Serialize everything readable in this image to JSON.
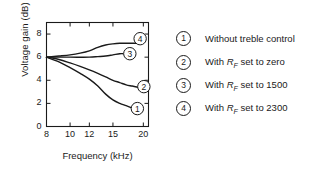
{
  "chart_data": {
    "type": "line",
    "title": "",
    "xlabel": "Frequency (kHz)",
    "ylabel": "Voltage gain (dB)",
    "x_ticks": [
      8,
      10,
      12,
      15,
      20
    ],
    "x_tick_labels": [
      "8",
      "10",
      "12",
      "15",
      "20"
    ],
    "y_ticks": [
      0,
      2,
      4,
      6,
      8
    ],
    "y_tick_labels": [
      "0",
      "2",
      "4",
      "6",
      "8"
    ],
    "xlim": [
      8,
      21
    ],
    "ylim": [
      0,
      9
    ],
    "x_scale": "log",
    "grid": false,
    "legend_position": "right-outside",
    "series": [
      {
        "name": "1",
        "label": "Without treble control",
        "x": [
          8,
          9,
          10,
          11,
          12,
          13,
          14,
          15,
          16,
          17,
          18
        ],
        "y": [
          6.0,
          5.6,
          5.1,
          4.6,
          4.1,
          3.5,
          2.8,
          2.3,
          2.0,
          1.8,
          1.6
        ]
      },
      {
        "name": "2",
        "label": "With RF set to zero",
        "x": [
          8,
          9,
          10,
          11,
          12,
          13,
          14,
          15,
          16,
          17,
          18,
          19
        ],
        "y": [
          6.0,
          5.8,
          5.5,
          5.2,
          4.9,
          4.6,
          4.3,
          4.0,
          3.8,
          3.6,
          3.5,
          3.4
        ]
      },
      {
        "name": "3",
        "label": "With RF set to 1500",
        "x": [
          8,
          10,
          12,
          13,
          14,
          15,
          16,
          16.5
        ],
        "y": [
          6.0,
          6.0,
          6.0,
          6.05,
          6.1,
          6.2,
          6.3,
          6.3
        ]
      },
      {
        "name": "4",
        "label": "With RF set to 2300",
        "x": [
          8,
          9,
          10,
          11,
          12,
          13,
          14,
          15,
          16,
          17,
          18,
          19
        ],
        "y": [
          6.0,
          6.1,
          6.2,
          6.35,
          6.55,
          6.85,
          7.05,
          7.15,
          7.2,
          7.2,
          7.2,
          7.2
        ]
      }
    ],
    "inline_labels": [
      {
        "text": "4",
        "x": 19.4,
        "y": 7.6
      },
      {
        "text": "3",
        "x": 17.6,
        "y": 6.3
      },
      {
        "text": "2",
        "x": 20.1,
        "y": 3.45
      },
      {
        "text": "1",
        "x": 18.9,
        "y": 1.55
      }
    ]
  },
  "legend": {
    "items": [
      {
        "number": "1",
        "prefix": "Without treble control",
        "symbol": "",
        "sub": "",
        "suffix": ""
      },
      {
        "number": "2",
        "prefix": "With ",
        "symbol": "R",
        "sub": "F",
        "suffix": " set to zero"
      },
      {
        "number": "3",
        "prefix": "With ",
        "symbol": "R",
        "sub": "F",
        "suffix": " set to 1500"
      },
      {
        "number": "4",
        "prefix": "With ",
        "symbol": "R",
        "sub": "F",
        "suffix": " set to 2300"
      }
    ]
  },
  "colors": {
    "ink": "#1a1a1a",
    "background": "#ffffff"
  }
}
